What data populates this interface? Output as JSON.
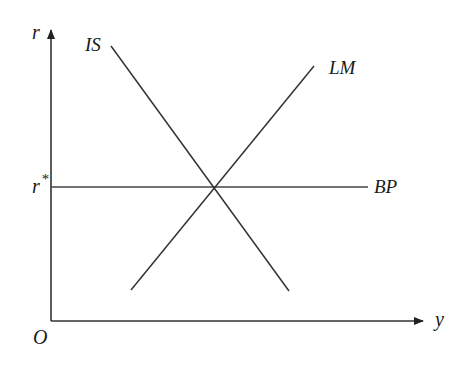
{
  "diagram": {
    "type": "IS-LM-BP",
    "axes": {
      "y_label": "r",
      "x_label": "y",
      "origin_label": "O"
    },
    "curves": {
      "is": {
        "label": "IS"
      },
      "lm": {
        "label": "LM"
      },
      "bp": {
        "label": "BP"
      }
    },
    "equilibrium_rate_label": "r",
    "equilibrium_rate_superscript": "*",
    "colors": {
      "line": "#333333",
      "text": "#1a1a1a"
    }
  }
}
